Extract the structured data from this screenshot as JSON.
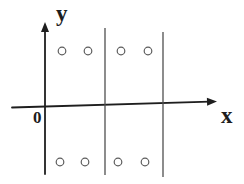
{
  "diagram": {
    "width": 244,
    "height": 184,
    "background": "#ffffff",
    "axis_color": "#1e1e1e",
    "line_color": "#4f4f4f",
    "circle_color": "#5c5c5c",
    "line_width": 1.3,
    "labels": {
      "y": "y",
      "x": "x",
      "origin": "0"
    },
    "x_axis": {
      "x1": 12,
      "y1": 107.5,
      "x2": 217,
      "y2": 101.5,
      "width": 1.8
    },
    "y_axis": {
      "x1": 45,
      "y1": 174,
      "x2": 45,
      "y2": 22,
      "width": 1.8
    },
    "arrowhead": {
      "length": 10,
      "half_width": 4
    },
    "vertical_lines": [
      {
        "x": 105,
        "y1": 28,
        "y2": 175
      },
      {
        "x": 163,
        "y1": 32,
        "y2": 177
      }
    ],
    "circles": {
      "radius": 3.8,
      "stroke_width": 1.2,
      "top_row_y": 51,
      "bottom_row_y": 162,
      "top_xs": [
        62,
        88,
        121,
        148
      ],
      "bottom_xs": [
        60,
        85,
        118,
        145
      ]
    }
  }
}
